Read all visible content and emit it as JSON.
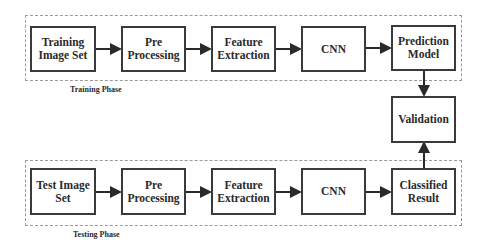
{
  "training": {
    "label": "Training Phase",
    "steps": [
      {
        "line1": "Training",
        "line2": "Image Set"
      },
      {
        "line1": "Pre",
        "line2": "Processing"
      },
      {
        "line1": "Feature",
        "line2": "Extraction"
      },
      {
        "line1": "CNN",
        "line2": ""
      },
      {
        "line1": "Prediction",
        "line2": "Model"
      }
    ]
  },
  "validation": {
    "label": "Validation"
  },
  "testing": {
    "label": "Testing Phase",
    "steps": [
      {
        "line1": "Test Image",
        "line2": "Set"
      },
      {
        "line1": "Pre",
        "line2": "Processing"
      },
      {
        "line1": "Feature",
        "line2": "Extraction"
      },
      {
        "line1": "CNN",
        "line2": ""
      },
      {
        "line1": "Classified",
        "line2": "Result"
      }
    ]
  }
}
